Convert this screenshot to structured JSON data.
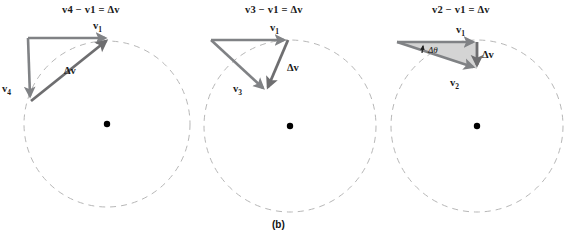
{
  "figure": {
    "caption": "(b)",
    "background_color": "#ffffff",
    "vector_color": "#808285",
    "circle_color": "#b3b3b3",
    "text_color": "#1a1a1a",
    "triangle_fill_color": "#d4d4d4",
    "center_dot_color": "#000000"
  },
  "panels": [
    {
      "id": "panel-1",
      "equation": "v₄ − v₁ = Δv",
      "equation_parts": {
        "term1": "v",
        "term1_sub": "4",
        "operator": "−",
        "term2": "v",
        "term2_sub": "1",
        "equals": "=",
        "result": "Δv"
      },
      "vectors": [
        {
          "name": "v1",
          "label": "v",
          "sub": "1",
          "from": [
            28,
            38
          ],
          "to": [
            110,
            38
          ],
          "label_pos": [
            93,
            22
          ]
        },
        {
          "name": "v4",
          "label": "v",
          "sub": "4",
          "from": [
            28,
            38
          ],
          "to": [
            31,
            101
          ],
          "label_pos": [
            3,
            88
          ]
        },
        {
          "name": "dv",
          "label": "Δv",
          "sub": "",
          "from": [
            31,
            101
          ],
          "to": [
            110,
            38
          ],
          "label_pos": [
            64,
            70
          ]
        }
      ],
      "circle": {
        "cx": 107,
        "cy": 124,
        "r": 83
      },
      "center_dot": {
        "cx": 107,
        "cy": 124,
        "r": 3.2
      },
      "triangle_filled": false,
      "angle_arc": null
    },
    {
      "id": "panel-2",
      "equation": "v₃ − v₁ = Δv",
      "equation_parts": {
        "term1": "v",
        "term1_sub": "3",
        "operator": "−",
        "term2": "v",
        "term2_sub": "1",
        "equals": "=",
        "result": "Δv"
      },
      "vectors": [
        {
          "name": "v1",
          "label": "v",
          "sub": "1",
          "from": [
            211,
            40
          ],
          "to": [
            288,
            40
          ],
          "label_pos": [
            270,
            24
          ]
        },
        {
          "name": "v3",
          "label": "v",
          "sub": "3",
          "from": [
            211,
            40
          ],
          "to": [
            266,
            91
          ],
          "label_pos": [
            233,
            88
          ]
        },
        {
          "name": "dv",
          "label": "Δv",
          "sub": "",
          "from": [
            288,
            40
          ],
          "to": [
            266,
            91
          ],
          "label_pos": [
            287,
            68
          ]
        }
      ],
      "circle": {
        "cx": 290,
        "cy": 126,
        "r": 86
      },
      "center_dot": {
        "cx": 290,
        "cy": 126,
        "r": 3.2
      },
      "triangle_filled": false,
      "angle_arc": null
    },
    {
      "id": "panel-3",
      "equation": "v₂ − v₁ = Δv",
      "equation_parts": {
        "term1": "v",
        "term1_sub": "2",
        "operator": "−",
        "term2": "v",
        "term2_sub": "1",
        "equals": "=",
        "result": "Δv"
      },
      "vectors": [
        {
          "name": "v1",
          "label": "v",
          "sub": "1",
          "from": [
            397,
            42
          ],
          "to": [
            477,
            42
          ],
          "label_pos": [
            456,
            26
          ]
        },
        {
          "name": "v2",
          "label": "v",
          "sub": "2",
          "from": [
            397,
            42
          ],
          "to": [
            477,
            69
          ],
          "label_pos": [
            452,
            83
          ]
        },
        {
          "name": "dv",
          "label": "Δv",
          "sub": "",
          "from": [
            477,
            42
          ],
          "to": [
            477,
            69
          ],
          "label_pos": [
            482,
            55
          ]
        }
      ],
      "circle": {
        "cx": 477,
        "cy": 126,
        "r": 86
      },
      "center_dot": {
        "cx": 477,
        "cy": 126,
        "r": 3.2
      },
      "triangle_filled": true,
      "angle_arc": {
        "label": "Δθ",
        "label_pos": [
          428,
          50
        ],
        "vertex": [
          397,
          42
        ],
        "radius": 26
      }
    }
  ]
}
